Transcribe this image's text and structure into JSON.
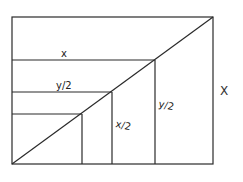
{
  "diagram": {
    "outer_rect": {
      "x1": 12,
      "y1": 17,
      "x2": 213,
      "y2": 164
    },
    "diagonal": {
      "from": [
        12,
        164
      ],
      "to": [
        213,
        17
      ]
    },
    "steps": [
      {
        "corner": [
          155,
          60
        ],
        "top_label": "x",
        "side_label": "y/2"
      },
      {
        "corner": [
          112,
          92
        ],
        "top_label": "y/2",
        "side_label": "x/2"
      },
      {
        "corner": [
          82,
          114
        ],
        "top_label": "",
        "side_label": ""
      }
    ],
    "labels": {
      "x_top": "x",
      "y_half_top": "y/2",
      "x_half_side": "x/2",
      "y_half_side": "y/2",
      "X_right": "X"
    },
    "line_color": "#2a2a2a"
  }
}
